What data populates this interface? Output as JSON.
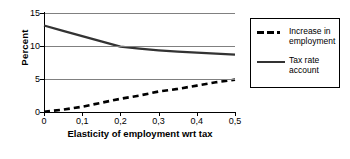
{
  "chart_data": {
    "type": "line",
    "title": "",
    "xlabel": "Elasticity of employment\nwrt tax",
    "ylabel": "Percent",
    "xlim": [
      0,
      0.5
    ],
    "ylim": [
      0,
      15
    ],
    "grid": true,
    "legend_position": "right",
    "x": [
      0,
      0.05,
      0.1,
      0.15,
      0.2,
      0.25,
      0.3,
      0.35,
      0.4,
      0.45,
      0.5
    ],
    "series": [
      {
        "name": "Increase in employment",
        "style": "dashed",
        "values": [
          0.05,
          0.35,
          0.8,
          1.4,
          2.0,
          2.5,
          3.1,
          3.5,
          4.0,
          4.5,
          4.9
        ]
      },
      {
        "name": "Tax rate account",
        "style": "solid",
        "values": [
          13.1,
          12.3,
          11.5,
          10.7,
          9.9,
          9.6,
          9.35,
          9.15,
          9.0,
          8.85,
          8.7
        ]
      }
    ],
    "yticks": [
      0,
      5,
      10,
      15
    ],
    "ytick_labels": [
      "0",
      "5",
      "10",
      "15"
    ],
    "xticks": [
      0,
      0.1,
      0.2,
      0.3,
      0.4,
      0.5
    ],
    "xtick_labels": [
      "0",
      "0,1",
      "0,2",
      "0,3",
      "0,4",
      "0,5"
    ],
    "colors": {
      "series_employment": "#000000",
      "series_taxrate": "#333333",
      "gridline": "#808080",
      "axis": "#000000",
      "background": "#ffffff"
    }
  },
  "legend": {
    "entries": [
      {
        "label": "Increase in\nemployment"
      },
      {
        "label": "Tax rate\naccount"
      }
    ]
  }
}
